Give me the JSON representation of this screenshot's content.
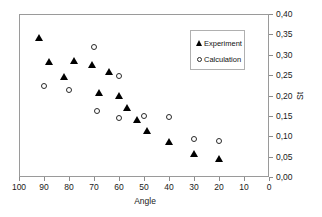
{
  "chart_data": {
    "type": "scatter",
    "title": "",
    "xlabel": "Angle",
    "ylabel": "St",
    "xlim": [
      100,
      0
    ],
    "ylim": [
      0.0,
      0.4
    ],
    "x_reversed": true,
    "y_axis_position": "right",
    "grid": false,
    "decimal_separator": ",",
    "xticks": [
      100,
      90,
      80,
      70,
      60,
      50,
      40,
      30,
      20,
      10,
      0
    ],
    "xtick_labels": [
      "100",
      "90",
      "80",
      "70",
      "60",
      "50",
      "40",
      "30",
      "20",
      "10",
      "0"
    ],
    "yticks": [
      0.0,
      0.05,
      0.1,
      0.15,
      0.2,
      0.25,
      0.3,
      0.35,
      0.4
    ],
    "ytick_labels": [
      "0,00",
      "0,05",
      "0,10",
      "0,15",
      "0,20",
      "0,25",
      "0,30",
      "0,35",
      "0,40"
    ],
    "legend_position": "upper right",
    "series": [
      {
        "name": "Experiment",
        "marker": "filled-triangle",
        "color": "#000000",
        "points": [
          {
            "x": 92,
            "y": 0.341
          },
          {
            "x": 88,
            "y": 0.283
          },
          {
            "x": 82,
            "y": 0.245
          },
          {
            "x": 78,
            "y": 0.285
          },
          {
            "x": 71,
            "y": 0.276
          },
          {
            "x": 68,
            "y": 0.207
          },
          {
            "x": 64,
            "y": 0.257
          },
          {
            "x": 60,
            "y": 0.2
          },
          {
            "x": 57,
            "y": 0.169
          },
          {
            "x": 53,
            "y": 0.14
          },
          {
            "x": 49,
            "y": 0.114
          },
          {
            "x": 40,
            "y": 0.087
          },
          {
            "x": 30,
            "y": 0.056
          },
          {
            "x": 20,
            "y": 0.043
          }
        ]
      },
      {
        "name": "Calculation",
        "marker": "open-circle",
        "color": "#2a2a2a",
        "points": [
          {
            "x": 90,
            "y": 0.224
          },
          {
            "x": 80,
            "y": 0.214
          },
          {
            "x": 70,
            "y": 0.32
          },
          {
            "x": 69,
            "y": 0.161
          },
          {
            "x": 60,
            "y": 0.249
          },
          {
            "x": 60,
            "y": 0.146
          },
          {
            "x": 50,
            "y": 0.149
          },
          {
            "x": 40,
            "y": 0.148
          },
          {
            "x": 30,
            "y": 0.093
          },
          {
            "x": 20,
            "y": 0.089
          }
        ]
      }
    ]
  },
  "legend": {
    "entries": [
      {
        "label": "Experiment",
        "symbol": "filled-triangle-icon"
      },
      {
        "label": "Calculation",
        "symbol": "open-circle-icon"
      }
    ]
  },
  "axes": {
    "x_title": "Angle",
    "y_title": "St"
  }
}
